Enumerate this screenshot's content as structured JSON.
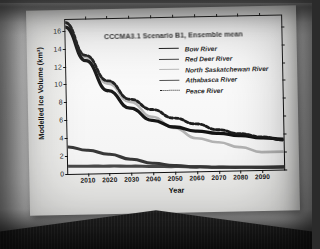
{
  "slide": {
    "title": "CCCMA3.1 Scenario B1, Ensemble mean"
  },
  "chart_data": {
    "type": "line",
    "title": "CCCMA3.1 Scenario B1, Ensemble mean",
    "xlabel": "Year",
    "ylabel": "Modelled Ice Volume (km³)",
    "xlim": [
      2001,
      2100
    ],
    "ylim": [
      0,
      17.2
    ],
    "grid": false,
    "legend_position": "top-right",
    "xticks": [
      2010,
      2020,
      2030,
      2040,
      2050,
      2060,
      2070,
      2080,
      2090
    ],
    "xtick_labels": [
      "2010",
      "2020",
      "2030",
      "2040",
      "2050",
      "2060",
      "2070",
      "2080",
      "2090"
    ],
    "yticks": [
      0,
      2,
      4,
      6,
      8,
      10,
      12,
      14,
      16
    ],
    "ytick_labels": [
      "0",
      "2",
      "4",
      "6",
      "8",
      "10",
      "12",
      "14",
      "16"
    ],
    "x": [
      2001,
      2010,
      2020,
      2030,
      2040,
      2050,
      2060,
      2070,
      2080,
      2090,
      2100
    ],
    "series": [
      {
        "name": "Bow River",
        "color": "#111111",
        "style": "solid",
        "width": 1.5,
        "values": [
          16.4,
          12.6,
          9.2,
          7.2,
          5.8,
          5.0,
          4.5,
          4.2,
          3.9,
          3.6,
          3.4
        ]
      },
      {
        "name": "Red Deer River",
        "color": "#3a3a3a",
        "style": "solid",
        "width": 1.4,
        "values": [
          3.0,
          2.6,
          2.1,
          1.5,
          1.0,
          0.7,
          0.5,
          0.4,
          0.35,
          0.3,
          0.3
        ]
      },
      {
        "name": "North Saskatchewan River",
        "color": "#b9b9b9",
        "style": "solid",
        "width": 1.2,
        "values": [
          16.9,
          13.0,
          10.0,
          7.9,
          6.2,
          4.9,
          3.7,
          3.2,
          2.6,
          2.0,
          2.0
        ]
      },
      {
        "name": "Athabasca River",
        "color": "#4d4d4d",
        "style": "solid",
        "width": 1.4,
        "values": [
          0.85,
          0.82,
          0.78,
          0.72,
          0.65,
          0.58,
          0.5,
          0.42,
          0.36,
          0.3,
          0.28
        ]
      },
      {
        "name": "Peace River",
        "color": "#1a1a1a",
        "style": "dotted",
        "width": 1.3,
        "values": [
          16.9,
          13.2,
          10.3,
          8.2,
          7.0,
          6.0,
          5.3,
          4.6,
          4.1,
          3.7,
          3.3
        ]
      }
    ]
  }
}
